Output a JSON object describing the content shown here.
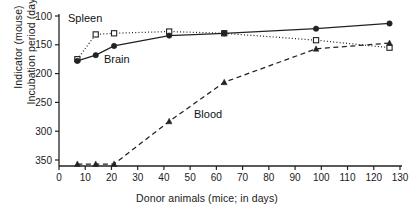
{
  "chart_data": {
    "type": "line",
    "title": "",
    "xlabel": "Donor animals (mice; in days)",
    "ylabel_lines": [
      "Indicator (mouse)",
      "Incubation period (days)"
    ],
    "xlim": [
      0,
      130
    ],
    "ylim": [
      100,
      365
    ],
    "y_inverted": true,
    "grid": false,
    "legend_position": "inline-annotations",
    "xticks": [
      0,
      10,
      20,
      30,
      40,
      50,
      60,
      70,
      80,
      90,
      100,
      110,
      120,
      130
    ],
    "yticks": [
      100,
      150,
      200,
      250,
      300,
      350
    ],
    "x": [
      7,
      14,
      21,
      42,
      63,
      98,
      126
    ],
    "series": [
      {
        "name": "Spleen",
        "marker": "open-square",
        "line_style": "dotted",
        "color": "#222222",
        "values": [
          175,
          132,
          130,
          127,
          130,
          142,
          155
        ]
      },
      {
        "name": "Brain",
        "marker": "filled-circle",
        "line_style": "solid",
        "color": "#222222",
        "values": [
          178,
          168,
          152,
          134,
          130,
          122,
          113
        ]
      },
      {
        "name": "Blood",
        "marker": "filled-triangle",
        "line_style": "dashed",
        "color": "#222222",
        "values": [
          365,
          365,
          365,
          283,
          215,
          157,
          147
        ],
        "note": "first three points plotted at axis floor (no disease / beyond scale)"
      }
    ],
    "annotations": [
      {
        "text": "Spleen",
        "x_px": 68,
        "y_px": 12
      },
      {
        "text": "Brain",
        "x_px": 104,
        "y_px": 53
      },
      {
        "text": "Blood",
        "x_px": 194,
        "y_px": 108
      }
    ]
  }
}
